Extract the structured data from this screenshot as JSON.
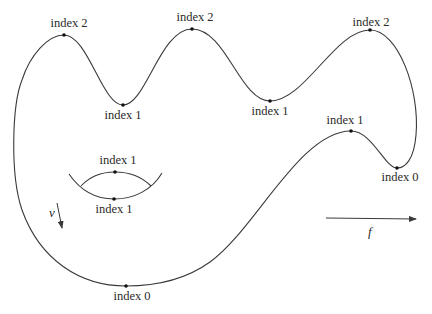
{
  "diagram": {
    "type": "morse-function-level-curve",
    "critical_points": [
      {
        "id": "max-left",
        "label": "index 2",
        "x": 64,
        "y": 35
      },
      {
        "id": "min-left",
        "label": "index 1",
        "x": 123,
        "y": 105
      },
      {
        "id": "max-middle",
        "label": "index 2",
        "x": 192,
        "y": 29
      },
      {
        "id": "min-middle",
        "label": "index 1",
        "x": 270,
        "y": 101
      },
      {
        "id": "max-right",
        "label": "index 2",
        "x": 370,
        "y": 30
      },
      {
        "id": "saddle-right",
        "label": "index 1",
        "x": 351,
        "y": 131
      },
      {
        "id": "min-right",
        "label": "index 0",
        "x": 397,
        "y": 168
      },
      {
        "id": "min-bottom",
        "label": "index 0",
        "x": 126,
        "y": 286
      }
    ],
    "lens": {
      "top_label": "index 1",
      "bottom_label": "index 1"
    },
    "vectors": {
      "v_label": "v",
      "f_label": "f"
    },
    "colors": {
      "stroke": "#3a3a3a",
      "text": "#2a2a2a",
      "background": "#ffffff"
    }
  }
}
